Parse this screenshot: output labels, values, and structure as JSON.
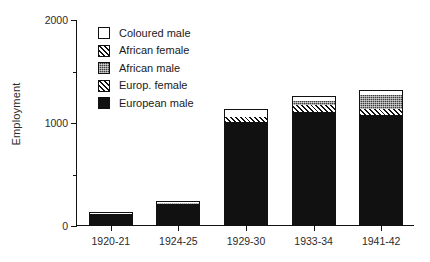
{
  "chart_data": {
    "type": "bar",
    "subtype": "stacked",
    "title": "",
    "xlabel": "",
    "ylabel": "Employment",
    "categories": [
      "1920-21",
      "1924-25",
      "1929-30",
      "1933-34",
      "1941-42"
    ],
    "ylim": [
      0,
      2000
    ],
    "yticks": [
      0,
      1000,
      2000
    ],
    "ytick_labels": [
      "0",
      "1000",
      "2000"
    ],
    "yticks_minor": [
      500,
      1500
    ],
    "grid": false,
    "legend_position": "upper-left-inside",
    "series": [
      {
        "name": "European male",
        "fill": "solid",
        "values": [
          110,
          200,
          1000,
          1100,
          1070
        ]
      },
      {
        "name": "Europ. female",
        "fill": "hatch",
        "values": [
          0,
          0,
          50,
          70,
          60
        ]
      },
      {
        "name": "African male",
        "fill": "stipple",
        "values": [
          0,
          20,
          0,
          30,
          130
        ]
      },
      {
        "name": "African female",
        "fill": "hatch",
        "values": [
          0,
          0,
          0,
          0,
          0
        ]
      },
      {
        "name": "Coloured male",
        "fill": "white",
        "values": [
          8,
          8,
          68,
          47,
          37
        ]
      }
    ],
    "totals": [
      118,
      228,
      1118,
      1247,
      1297
    ]
  },
  "legend": {
    "items": [
      {
        "label": "Coloured male",
        "swatch": "white-swatch"
      },
      {
        "label": "African female",
        "swatch": "hatch-swatch"
      },
      {
        "label": "African male",
        "swatch": "stipple-swatch"
      },
      {
        "label": "Europ. female",
        "swatch": "hatch-swatch"
      },
      {
        "label": "European male",
        "swatch": "solid-swatch"
      }
    ]
  },
  "colors": {
    "axis": "#111111",
    "solid_fill": "#111111",
    "stipple_fill": "#3d3d3d",
    "hatch_fill": "#ffffff",
    "white_fill": "#ffffff",
    "background": "#ffffff"
  }
}
